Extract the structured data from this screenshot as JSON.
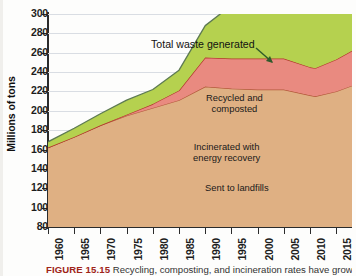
{
  "figure": {
    "caption_number": "FIGURE 15.15",
    "caption_text": "Recycling, composting, and incineration rates have grown over time."
  },
  "chart_data": {
    "type": "area",
    "title": "",
    "xlabel": "",
    "ylabel": "Millions of tons",
    "ylim": [
      80,
      300
    ],
    "xlim": [
      1960,
      2018
    ],
    "ytick_step": 20,
    "grid": true,
    "legend_position": "inline-annotations",
    "yticks": [
      80,
      100,
      120,
      140,
      160,
      180,
      200,
      220,
      240,
      260,
      280,
      300
    ],
    "xticks": [
      1960,
      1965,
      1970,
      1975,
      1980,
      1985,
      1990,
      1995,
      2000,
      2005,
      2010,
      2015
    ],
    "x": [
      1960,
      1965,
      1970,
      1975,
      1980,
      1985,
      1990,
      1995,
      2000,
      2005,
      2010,
      2011,
      2015,
      2018
    ],
    "stacked": true,
    "series": [
      {
        "name": "Sent to landfills",
        "color": "#dfb083",
        "line_color": "#b3593a",
        "values": [
          82,
          93,
          105,
          115,
          123,
          131,
          145,
          143,
          142,
          142,
          136,
          135,
          140,
          146
        ]
      },
      {
        "name": "Incinerated with energy recovery",
        "color": "#e98a80",
        "line_color": "#b3362c",
        "values": [
          0,
          0,
          0,
          1,
          4,
          10,
          30,
          31,
          32,
          32,
          29,
          29,
          33,
          36
        ]
      },
      {
        "name": "Recycled and composted",
        "color": "#b5d14f",
        "line_color": "#5d7a52",
        "values": [
          6,
          9,
          12,
          15,
          15,
          21,
          33,
          55,
          76,
          80,
          85,
          86,
          92,
          113
        ]
      }
    ],
    "cumulative_totals": [
      88,
      102,
      117,
      131,
      142,
      162,
      208,
      229,
      250,
      254,
      250,
      250,
      265,
      295
    ],
    "annotations": [
      {
        "name": "total-waste-generated",
        "text": "Total waste generated",
        "points_to_year": 2000
      },
      {
        "name": "recycled-and-composted",
        "text": "Recycled and\ncomposted"
      },
      {
        "name": "incinerated-with-energy-recovery",
        "text": "Incinerated with\nenergy recovery"
      },
      {
        "name": "sent-to-landfills",
        "text": "Sent to landfills"
      }
    ],
    "label_lines": {
      "total": "Total waste generated",
      "recycled_1": "Recycled and",
      "recycled_2": "composted",
      "incinerated_1": "Incinerated with",
      "incinerated_2": "energy recovery",
      "landfill": "Sent to landfills"
    }
  },
  "colors": {
    "landfill": "#dfb083",
    "incinerated": "#e98a80",
    "recycled": "#b5d14f",
    "figure_number": "#9f2418"
  }
}
